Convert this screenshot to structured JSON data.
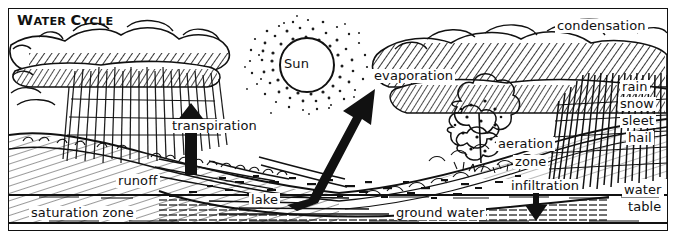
{
  "diagram": {
    "title": "Water Cycle",
    "title_caps_first": "W",
    "title_rest_1": "ATER ",
    "title_caps_second": "C",
    "title_rest_2": "YCLE",
    "style": "black and white pen-and-ink line art",
    "colors": {
      "ink": "#111111",
      "paper": "#ffffff"
    }
  },
  "labels": {
    "sun": "Sun",
    "condensation": "condensation",
    "evaporation": "evaporation",
    "transpiration": "transpiration",
    "rain": "rain",
    "snow": "snow",
    "sleet": "sleet",
    "hail": "hail",
    "aeration_zone_line1": "aeration",
    "aeration_zone_line2": "zone",
    "infiltration": "infiltration",
    "water_table_line1": "water",
    "water_table_line2": "table",
    "runoff": "runoff",
    "lake": "lake",
    "ground_water": "ground water",
    "saturation_zone": "saturation zone"
  },
  "arrows": [
    {
      "name": "transpiration-arrow",
      "direction": "up",
      "style": "thick solid black"
    },
    {
      "name": "evaporation-arrow",
      "direction": "up-right",
      "style": "thick solid black"
    },
    {
      "name": "infiltration-arrow",
      "direction": "down",
      "style": "thick solid black"
    }
  ],
  "features": [
    "hatched clouds across the top",
    "vertical rain streaks falling from left cloud",
    "dense vertical precipitation streaks from right cloud",
    "stippled sun halo with open circle at center",
    "tree with foliage at right-center",
    "hatched hillside terrain",
    "lake basin with horizontal water hatching",
    "water table line across lower portion",
    "saturation zone band at the bottom"
  ]
}
